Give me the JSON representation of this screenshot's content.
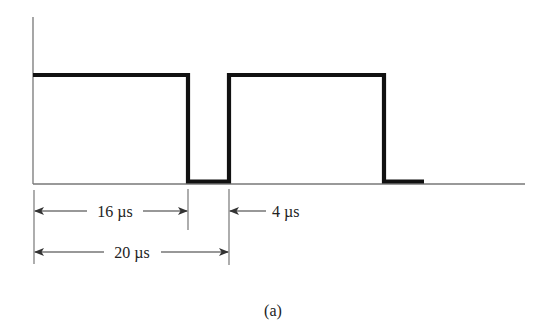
{
  "figure": {
    "caption": "(a)",
    "colors": {
      "background": "#ffffff",
      "signal": "#111111",
      "axis": "#777777",
      "annotation": "#555555",
      "text": "#222222"
    }
  },
  "waveform": {
    "description": "Rectangular pulse train: high for 16 µs, low for 4 µs, period 20 µs",
    "high_time": "16 µs",
    "low_time": "4 µs",
    "period": "20 µs",
    "levels": [
      "low",
      "high"
    ],
    "segments": [
      {
        "level": "high",
        "start_us": 0,
        "end_us": 16
      },
      {
        "level": "low",
        "start_us": 16,
        "end_us": 20
      },
      {
        "level": "high",
        "start_us": 20,
        "end_us": 36
      },
      {
        "level": "low",
        "start_us": 36,
        "end_us": 40
      }
    ]
  },
  "annotations": {
    "high_duration_label": "16 µs",
    "low_duration_label": "4 µs",
    "period_label": "20 µs"
  }
}
